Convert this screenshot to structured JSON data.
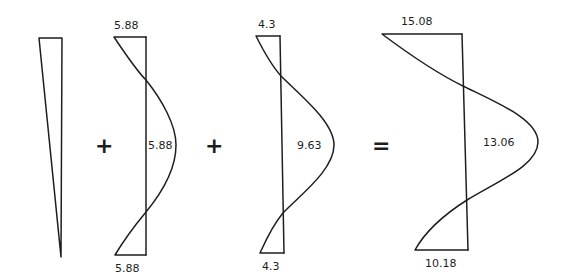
{
  "diagram": {
    "operators": [
      "+",
      "+",
      "="
    ],
    "components": [
      {
        "name": "linear-diagram",
        "labels": {}
      },
      {
        "name": "diagram-2",
        "labels": {
          "top": "5.88",
          "middle": "5.88",
          "bottom": "5.88"
        }
      },
      {
        "name": "diagram-3",
        "labels": {
          "top": "4.3",
          "middle": "9.63",
          "bottom": "4.3"
        }
      },
      {
        "name": "result-diagram",
        "labels": {
          "top": "15.08",
          "middle": "13.06",
          "bottom": "10.18"
        }
      }
    ]
  }
}
